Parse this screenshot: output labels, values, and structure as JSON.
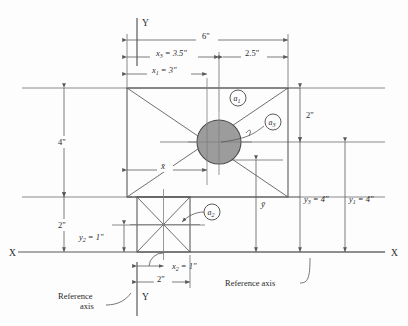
{
  "figure": {
    "type": "engineering-centroid-diagram",
    "axes": {
      "x_axis_label_left": "X",
      "x_axis_label_right": "X",
      "y_axis_label_top": "Y",
      "y_axis_label_bottom": "Y"
    },
    "reference_axis_labels": [
      {
        "id": "ref-bottom-left",
        "line1": "Reference",
        "line2": "axis"
      },
      {
        "id": "ref-bottom-right",
        "text": "Reference axis"
      }
    ],
    "horizontal_dimensions": [
      {
        "id": "overall-width",
        "label": "6\""
      },
      {
        "id": "x3",
        "label": "x",
        "sub": "3",
        "value": "= 3.5\""
      },
      {
        "id": "right-seg",
        "label": "2.5\""
      },
      {
        "id": "x1",
        "label": "x",
        "sub": "1",
        "value": "= 3\""
      },
      {
        "id": "xbar",
        "label": "x̄"
      },
      {
        "id": "x2",
        "label": "x",
        "sub": "2",
        "value": "= 1\""
      },
      {
        "id": "square-width",
        "label": "2\""
      }
    ],
    "vertical_dimensions": [
      {
        "id": "left-height",
        "label": "4\""
      },
      {
        "id": "left-lower",
        "label": "2\""
      },
      {
        "id": "y2",
        "label": "y",
        "sub": "2",
        "value": "= 1\""
      },
      {
        "id": "right-upper",
        "label": "2\""
      },
      {
        "id": "y3",
        "label": "y",
        "sub": "3",
        "value": "= 4\""
      },
      {
        "id": "y1",
        "label": "y",
        "sub": "1",
        "value": "= 4\""
      },
      {
        "id": "ybar",
        "label": "ȳ"
      }
    ],
    "area_callouts": [
      {
        "id": "a1",
        "label": "a",
        "sub": "1"
      },
      {
        "id": "a2",
        "label": "a",
        "sub": "2"
      },
      {
        "id": "a3",
        "label": "a",
        "sub": "3"
      }
    ],
    "colors": {
      "hole_fill": "#9c9c9c",
      "outline": "#4a4a4a",
      "dimension_line": "#5a5a5a",
      "background": "#fdfdfd"
    }
  }
}
